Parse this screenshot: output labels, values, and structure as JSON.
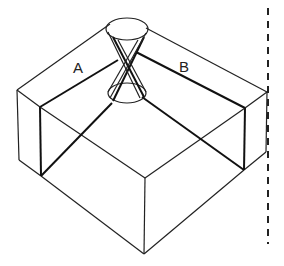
{
  "diagram": {
    "labels": {
      "a": "A",
      "b": "B"
    },
    "colors": {
      "stroke": "#222222",
      "background": "#ffffff"
    }
  }
}
